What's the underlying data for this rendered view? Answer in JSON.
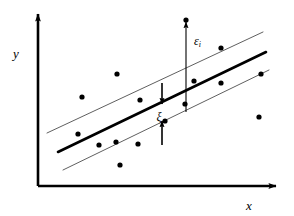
{
  "figure": {
    "name": "epsilon-insensitive-regression-diagram",
    "background_color": "#ffffff",
    "ink_color": "#000000",
    "band_line_color": "#555555"
  },
  "axes": {
    "x_label": "x",
    "y_label": "y",
    "x_axis": {
      "x1": 38,
      "y1": 186,
      "x2": 276,
      "y2": 186
    },
    "y_axis": {
      "x1": 38,
      "y1": 186,
      "x2": 38,
      "y2": 14
    },
    "x_label_pos": {
      "x": 249,
      "y": 207
    },
    "y_label_pos": {
      "x": 16,
      "y": 55
    }
  },
  "annotations": {
    "epsilon_label": "ε",
    "epsilon_subscript": "i",
    "epsilon_label_pos": {
      "x": 194,
      "y": 42
    },
    "xi_label": "ξ",
    "xi_label_pos": {
      "x": 159,
      "y": 118
    }
  },
  "chart_data": {
    "type": "scatter",
    "title": "",
    "xlabel": "x",
    "ylabel": "y",
    "grid": false,
    "legend": null,
    "axis_units": "pixels",
    "note": "Scatter of observations with a fitted regression line and a symmetric epsilon-tube (two thin parallel margin lines). Arrows mark the residual epsilon_i of one outlying point and the slack xi measured from the band edges to the fitted line.",
    "points": [
      {
        "x": 117,
        "y": 74
      },
      {
        "x": 82,
        "y": 97
      },
      {
        "x": 140,
        "y": 100
      },
      {
        "x": 78,
        "y": 134
      },
      {
        "x": 99,
        "y": 145
      },
      {
        "x": 116,
        "y": 142
      },
      {
        "x": 138,
        "y": 144
      },
      {
        "x": 120,
        "y": 165
      },
      {
        "x": 186,
        "y": 20
      },
      {
        "x": 221,
        "y": 48
      },
      {
        "x": 194,
        "y": 81
      },
      {
        "x": 221,
        "y": 83
      },
      {
        "x": 185,
        "y": 104
      },
      {
        "x": 261,
        "y": 74
      },
      {
        "x": 259,
        "y": 117
      },
      {
        "x": 165,
        "y": 121
      }
    ],
    "point_radius": 2.6,
    "fit_line": {
      "x1": 58,
      "y1": 152,
      "x2": 266,
      "y2": 52,
      "width": 2.6
    },
    "upper_band": {
      "x1": 47,
      "y1": 133,
      "x2": 263,
      "y2": 32,
      "width": 0.9
    },
    "lower_band": {
      "x1": 63,
      "y1": 170,
      "x2": 269,
      "y2": 70,
      "width": 0.9
    },
    "epsilon_arrow": {
      "x": 186,
      "y_tail": 112,
      "y_head": 22
    },
    "xi_arrow_down": {
      "x": 162,
      "y_tail": 83,
      "y_head": 104
    },
    "xi_arrow_up": {
      "x": 162,
      "y_tail": 145,
      "y_head": 121
    }
  }
}
